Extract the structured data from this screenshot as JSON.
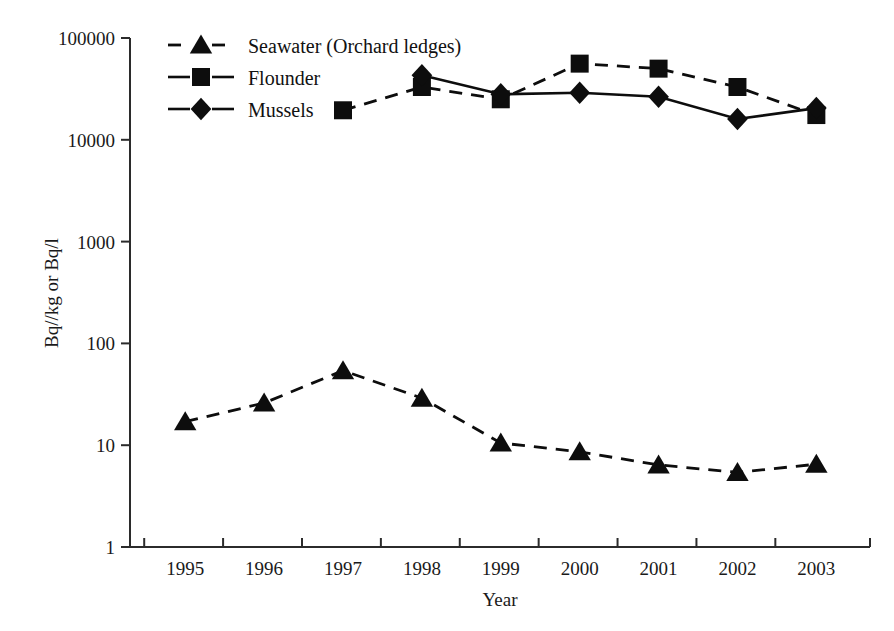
{
  "chart_data": {
    "type": "line",
    "title": "",
    "subtitle": "",
    "xlabel": "Year",
    "ylabel": "Bq//kg or Bq/l",
    "x": [
      1995,
      1996,
      1997,
      1998,
      1999,
      2000,
      2001,
      2002,
      2003
    ],
    "categories": [
      "1995",
      "1996",
      "1997",
      "1998",
      "1999",
      "2000",
      "2001",
      "2002",
      "2003"
    ],
    "yscale": "log",
    "ylim": [
      1,
      100000
    ],
    "ytick_labels": [
      "100000",
      "10000",
      "1000",
      "100",
      "10",
      "1"
    ],
    "ytick_values": [
      100000,
      10000,
      1000,
      100,
      10,
      1
    ],
    "grid": false,
    "legend_position": "top-left",
    "series": [
      {
        "name": "Seawater (Orchard ledges)",
        "marker": "triangle",
        "line_style": "dashed",
        "color": "#0d0d0d",
        "x": [
          1995,
          1996,
          1997,
          1998,
          1999,
          2000,
          2001,
          2002,
          2003
        ],
        "values": [
          17,
          26,
          54,
          29,
          10.5,
          8.6,
          6.4,
          5.4,
          6.5
        ]
      },
      {
        "name": "Flounder",
        "marker": "square",
        "line_style": "dashed",
        "color": "#0d0d0d",
        "x": [
          1997,
          1998,
          1999,
          2000,
          2001,
          2002,
          2003
        ],
        "values": [
          19500,
          33000,
          25000,
          56000,
          50000,
          33000,
          17500
        ]
      },
      {
        "name": "Mussels",
        "marker": "diamond",
        "line_style": "solid",
        "color": "#0d0d0d",
        "x": [
          1998,
          1999,
          2000,
          2001,
          2002,
          2003
        ],
        "values": [
          43000,
          28000,
          29000,
          26500,
          16000,
          20500
        ]
      }
    ],
    "legend_entries": [
      {
        "label": "Seawater (Orchard ledges)",
        "marker": "triangle",
        "line_style": "dashed"
      },
      {
        "label": "Flounder",
        "marker": "square",
        "line_style": "solid"
      },
      {
        "label": "Mussels",
        "marker": "diamond",
        "line_style": "solid"
      }
    ]
  }
}
